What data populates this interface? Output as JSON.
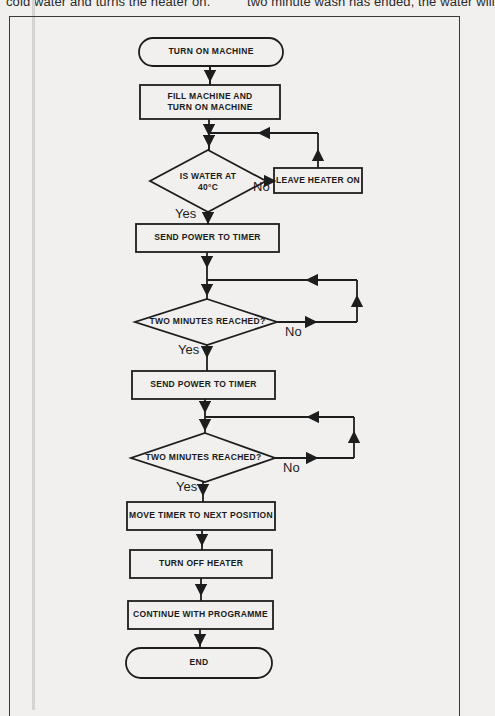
{
  "page_text": {
    "left_column_fragment": "cold water and turns the heater on.",
    "right_column_fragment": "two minute wash has ended, the water will"
  },
  "flowchart": {
    "start": "TURN ON MACHINE",
    "step_fill": "FILL MACHINE AND TURN ON MACHINE",
    "decision_temp": "IS WATER AT 40°C",
    "action_heater_on": "LEAVE HEATER ON",
    "step_power_1": "SEND POWER TO TIMER",
    "decision_time_1": "TWO MINUTES REACHED?",
    "step_power_2": "SEND POWER TO TIMER",
    "decision_time_2": "TWO MINUTES REACHED?",
    "step_move_timer": "MOVE TIMER TO NEXT POSITION",
    "step_heater_off": "TURN OFF HEATER",
    "step_continue": "CONTINUE WITH PROGRAMME",
    "end": "END",
    "labels": {
      "yes": "Yes",
      "no": "No"
    }
  },
  "colors": {
    "paper": "#f1f0ee",
    "ink": "#1d1d1d"
  }
}
